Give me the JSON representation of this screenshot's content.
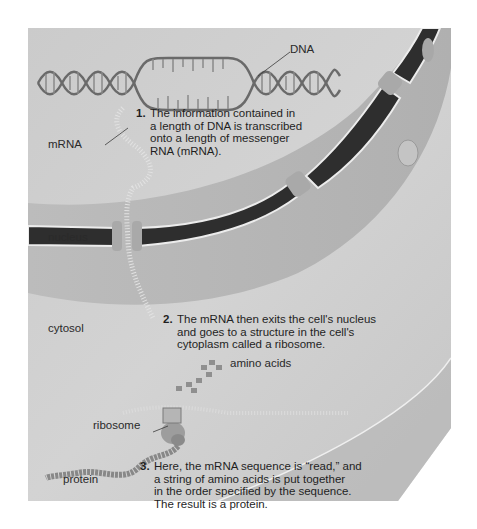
{
  "figure": {
    "colors": {
      "background": "#cfcfcf",
      "nucleus_envelope_dark": "#2e2e2e",
      "nucleus_envelope_light": "#ececec",
      "envelope_surface": "#bdbdbd",
      "text": "#1f1f1f"
    },
    "labels": {
      "dna": "DNA",
      "mrna": "mRNA",
      "nucleus": "nucleus",
      "cytosol": "cytosol",
      "amino_acids": "amino acids",
      "ribosome": "ribosome",
      "protein": "protein"
    },
    "steps": [
      {
        "number": "1.",
        "lines": [
          "The information contained in",
          "a length of DNA is transcribed",
          "onto a length of messenger",
          "RNA (mRNA)."
        ]
      },
      {
        "number": "2.",
        "lines": [
          "The mRNA then exits the cell's nucleus",
          "and goes to a structure in the cell's",
          "cytoplasm called a ribosome."
        ]
      },
      {
        "number": "3.",
        "lines": [
          "Here, the mRNA sequence is “read,” and",
          "a string of amino acids is put together",
          "in the order specified by the sequence.",
          "The result is a protein."
        ]
      }
    ]
  }
}
